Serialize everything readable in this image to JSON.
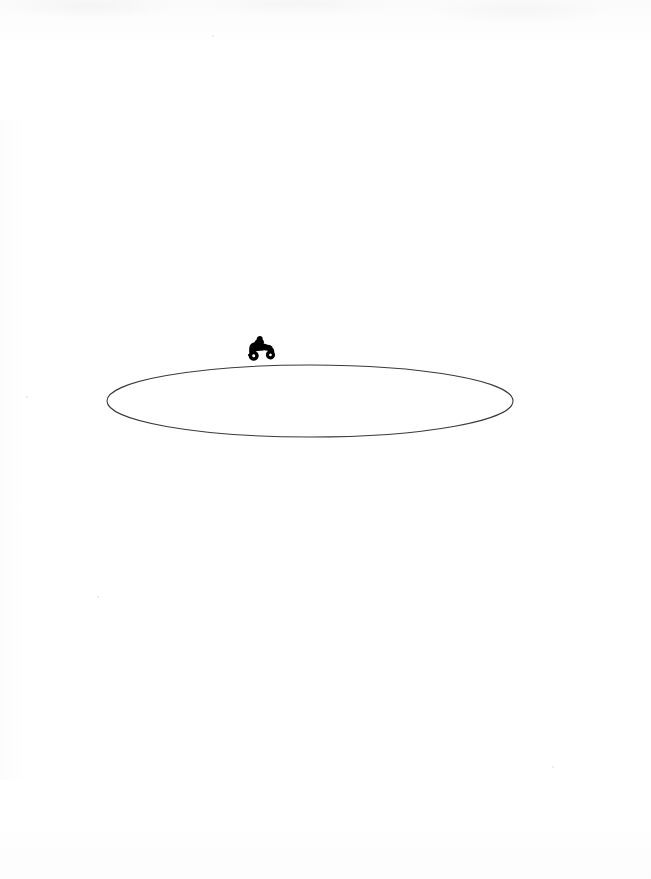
{
  "page": {
    "medium": "line drawing on white paper",
    "width": 651,
    "height": 879,
    "background_color": "#ffffff",
    "caption": ""
  },
  "artwork": {
    "description": "A single thin elliptical outline drawn in perspective, with a small solid black motorcycle-and-rider silhouette positioned on the upper-left arc of the ellipse, facing right.",
    "ink_color": "#3a3a3c",
    "silhouette_color": "#000000",
    "elements": [
      {
        "name": "track-ellipse",
        "shape": "ellipse",
        "center_x": 310,
        "center_y": 401,
        "radius_x": 203,
        "radius_y": 36,
        "stroke_color": "#3a3a3c",
        "stroke_width": 1.1,
        "fill": "none",
        "label": "Elliptical track outline"
      },
      {
        "name": "motorcycle-silhouette",
        "shape": "filled-silhouette",
        "x": 245,
        "y": 337,
        "width": 30,
        "height": 25,
        "fill_color": "#000000",
        "facing": "right",
        "label": "Motorcycle with rider"
      }
    ],
    "specks": [
      {
        "x": 26,
        "y": 396
      },
      {
        "x": 97,
        "y": 596
      },
      {
        "x": 552,
        "y": 766
      },
      {
        "x": 212,
        "y": 35
      }
    ]
  }
}
